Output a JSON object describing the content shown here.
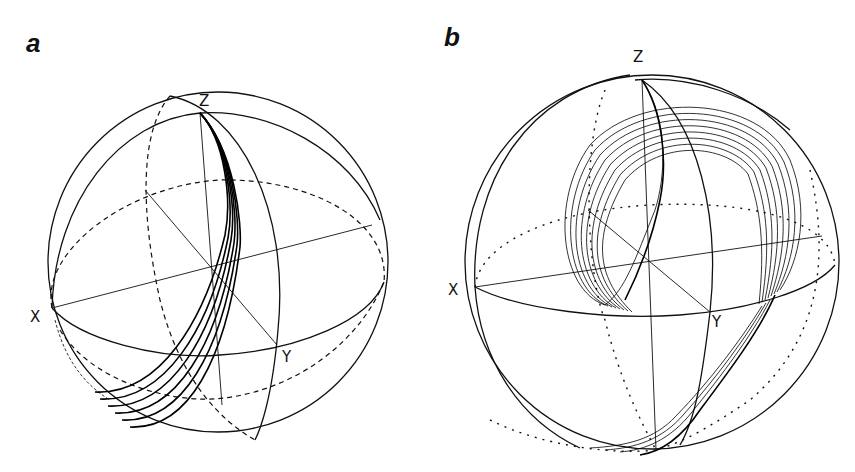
{
  "figure": {
    "panels": [
      {
        "id": "a",
        "label": "a",
        "axes": {
          "x": "X",
          "y": "Y",
          "z": "Z"
        },
        "description": "Unit sphere with great circles; bundle of trajectories from Z pole sweeping down to lower-left"
      },
      {
        "id": "b",
        "label": "b",
        "axes": {
          "x": "X",
          "y": "Y",
          "z": "Z"
        },
        "description": "Unit sphere with great circles; family of looping trajectories from Z pole wrapping around and down to the bottom"
      }
    ]
  }
}
